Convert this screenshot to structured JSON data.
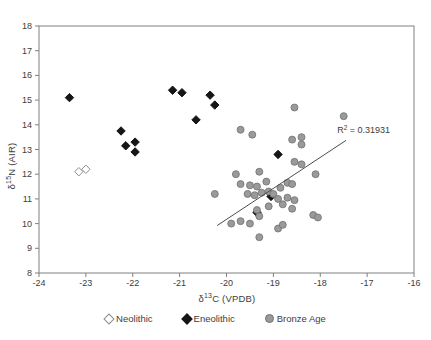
{
  "chart_data": {
    "type": "scatter",
    "title": "",
    "xlabel": {
      "prefix": "δ",
      "sup": "13",
      "rest": "C (VPDB)"
    },
    "ylabel": {
      "prefix": "δ",
      "sup": "15",
      "rest": "N (AIR)"
    },
    "xlim": [
      -24,
      -16
    ],
    "ylim": [
      8,
      18
    ],
    "x_ticks": [
      -24,
      -23,
      -22,
      -21,
      -20,
      -19,
      -18,
      -17,
      -16
    ],
    "y_ticks": [
      8,
      9,
      10,
      11,
      12,
      13,
      14,
      15,
      16,
      17,
      18
    ],
    "grid": false,
    "legend_position": "bottom",
    "frame_color": "#808080",
    "text_color": "#3d3d3d",
    "series": [
      {
        "name": "Neolithic",
        "marker": "open-diamond",
        "fill": "#ffffff",
        "stroke": "#8c8c8c",
        "points": [
          [
            -23.15,
            12.1
          ],
          [
            -23.0,
            12.2
          ]
        ]
      },
      {
        "name": "Eneolithic",
        "marker": "filled-diamond",
        "fill": "#161616",
        "stroke": "#161616",
        "points": [
          [
            -23.35,
            15.1
          ],
          [
            -22.25,
            13.75
          ],
          [
            -22.15,
            13.15
          ],
          [
            -21.95,
            13.3
          ],
          [
            -21.95,
            12.9
          ],
          [
            -21.15,
            15.4
          ],
          [
            -20.95,
            15.3
          ],
          [
            -20.35,
            15.2
          ],
          [
            -20.25,
            14.8
          ],
          [
            -20.65,
            14.2
          ],
          [
            -18.9,
            12.8
          ],
          [
            -19.05,
            11.1
          ],
          [
            -19.35,
            10.45
          ]
        ]
      },
      {
        "name": "Bronze Age",
        "marker": "circle",
        "fill": "#9a9a9a",
        "stroke": "#707070",
        "points": [
          [
            -18.55,
            14.7
          ],
          [
            -17.5,
            14.35
          ],
          [
            -19.7,
            13.8
          ],
          [
            -19.45,
            13.6
          ],
          [
            -18.6,
            13.4
          ],
          [
            -18.4,
            13.5
          ],
          [
            -18.4,
            13.2
          ],
          [
            -18.55,
            12.5
          ],
          [
            -18.4,
            12.4
          ],
          [
            -18.1,
            12.0
          ],
          [
            -19.8,
            12.0
          ],
          [
            -19.3,
            12.1
          ],
          [
            -19.7,
            11.6
          ],
          [
            -19.5,
            11.55
          ],
          [
            -19.35,
            11.5
          ],
          [
            -19.15,
            11.7
          ],
          [
            -18.7,
            11.65
          ],
          [
            -18.6,
            11.6
          ],
          [
            -18.85,
            11.45
          ],
          [
            -20.25,
            11.2
          ],
          [
            -19.55,
            11.2
          ],
          [
            -19.4,
            11.15
          ],
          [
            -19.25,
            11.25
          ],
          [
            -19.1,
            11.3
          ],
          [
            -19.0,
            11.2
          ],
          [
            -18.9,
            11.0
          ],
          [
            -18.7,
            11.05
          ],
          [
            -18.55,
            10.95
          ],
          [
            -18.8,
            10.78
          ],
          [
            -19.1,
            10.7
          ],
          [
            -19.35,
            10.55
          ],
          [
            -18.6,
            10.6
          ],
          [
            -18.15,
            10.35
          ],
          [
            -18.05,
            10.25
          ],
          [
            -19.3,
            10.3
          ],
          [
            -19.9,
            10.0
          ],
          [
            -19.7,
            10.1
          ],
          [
            -19.5,
            10.0
          ],
          [
            -18.9,
            9.8
          ],
          [
            -18.8,
            9.95
          ],
          [
            -19.3,
            9.45
          ]
        ]
      }
    ],
    "trendline": {
      "x1": -20.2,
      "y1": 9.92,
      "x2": -17.45,
      "y2": 13.37,
      "color": "#4d4d4d"
    },
    "annotation": {
      "prefix": "R",
      "sup": "2",
      "rest": " = 0.31931",
      "x": -17.64,
      "y": 13.79
    }
  },
  "legend": {
    "items": [
      {
        "label": "Neolithic"
      },
      {
        "label": "Eneolithic"
      },
      {
        "label": "Bronze Age"
      }
    ]
  }
}
